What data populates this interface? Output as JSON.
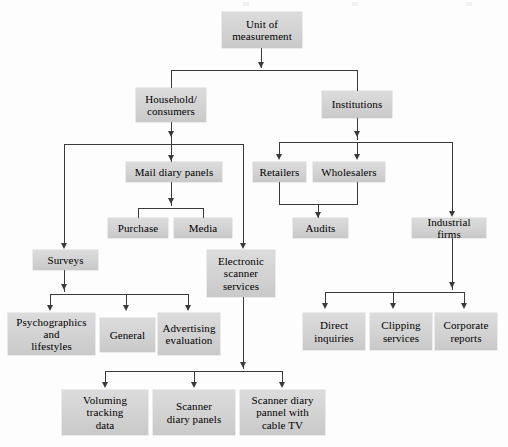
{
  "diagram": {
    "type": "flowchart",
    "orientation": "top-down",
    "node_fill_color": "#d4d4d4",
    "connector_color": "#3a3a3a",
    "nodes": [
      {
        "id": "root",
        "label": "Unit of\nmeasurement",
        "lines": [
          "Unit of",
          "measurement"
        ]
      },
      {
        "id": "household",
        "label": "Household/\nconsumers",
        "lines": [
          "Household/",
          "consumers"
        ]
      },
      {
        "id": "institutions",
        "label": "Institutions",
        "lines": [
          "Institutions"
        ]
      },
      {
        "id": "maildiary",
        "label": "Mail diary panels",
        "lines": [
          "Mail diary panels"
        ]
      },
      {
        "id": "retailers",
        "label": "Retailers",
        "lines": [
          "Retailers"
        ]
      },
      {
        "id": "wholesalers",
        "label": "Wholesalers",
        "lines": [
          "Wholesalers"
        ]
      },
      {
        "id": "purchase",
        "label": "Purchase",
        "lines": [
          "Purchase"
        ]
      },
      {
        "id": "media",
        "label": "Media",
        "lines": [
          "Media"
        ]
      },
      {
        "id": "audits",
        "label": "Audits",
        "lines": [
          "Audits"
        ]
      },
      {
        "id": "industrial",
        "label": "Industrial firms",
        "lines": [
          "Industrial firms"
        ]
      },
      {
        "id": "surveys",
        "label": "Surveys",
        "lines": [
          "Surveys"
        ]
      },
      {
        "id": "escanner",
        "label": "Electronic\nscanner\nservices",
        "lines": [
          "Electronic",
          "scanner",
          "services"
        ]
      },
      {
        "id": "psycho",
        "label": "Psychographics\nand\nlifestyles",
        "lines": [
          "Psychographics",
          "and",
          "lifestyles"
        ]
      },
      {
        "id": "general",
        "label": "General",
        "lines": [
          "General"
        ]
      },
      {
        "id": "advertising",
        "label": "Advertising\nevaluation",
        "lines": [
          "Advertising",
          "evaluation"
        ]
      },
      {
        "id": "directinq",
        "label": "Direct\ninquiries",
        "lines": [
          "Direct",
          "inquiries"
        ]
      },
      {
        "id": "clipping",
        "label": "Clipping\nservices",
        "lines": [
          "Clipping",
          "services"
        ]
      },
      {
        "id": "corporate",
        "label": "Corporate\nreports",
        "lines": [
          "Corporate",
          "reports"
        ]
      },
      {
        "id": "voluming",
        "label": "Voluming\ntracking\ndata",
        "lines": [
          "Voluming",
          "tracking",
          "data"
        ]
      },
      {
        "id": "scannerdiary",
        "label": "Scanner\ndiary panels",
        "lines": [
          "Scanner",
          "diary panels"
        ]
      },
      {
        "id": "scannercable",
        "label": "Scanner diary\npannel with\ncable TV",
        "lines": [
          "Scanner diary",
          "pannel with",
          "cable TV"
        ]
      }
    ],
    "edges": [
      {
        "from": "root",
        "to": "household"
      },
      {
        "from": "root",
        "to": "institutions"
      },
      {
        "from": "household",
        "to": "surveys"
      },
      {
        "from": "household",
        "to": "maildiary"
      },
      {
        "from": "household",
        "to": "escanner"
      },
      {
        "from": "maildiary",
        "to": "purchase"
      },
      {
        "from": "maildiary",
        "to": "media"
      },
      {
        "from": "institutions",
        "to": "retailers"
      },
      {
        "from": "institutions",
        "to": "wholesalers"
      },
      {
        "from": "institutions",
        "to": "industrial"
      },
      {
        "from": "retailers",
        "to": "audits"
      },
      {
        "from": "wholesalers",
        "to": "audits"
      },
      {
        "from": "surveys",
        "to": "psycho"
      },
      {
        "from": "surveys",
        "to": "general"
      },
      {
        "from": "surveys",
        "to": "advertising"
      },
      {
        "from": "industrial",
        "to": "directinq"
      },
      {
        "from": "industrial",
        "to": "clipping"
      },
      {
        "from": "industrial",
        "to": "corporate"
      },
      {
        "from": "escanner",
        "to": "voluming"
      },
      {
        "from": "escanner",
        "to": "scannerdiary"
      },
      {
        "from": "escanner",
        "to": "scannercable"
      }
    ]
  }
}
